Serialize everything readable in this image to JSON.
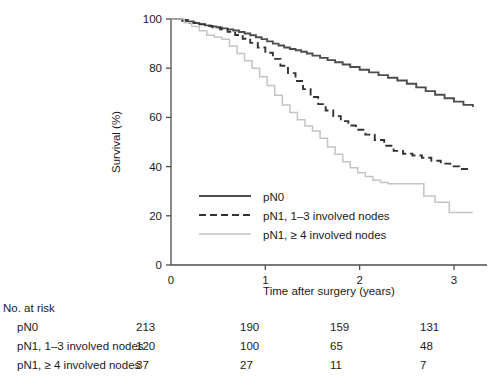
{
  "chart_data": {
    "type": "line",
    "title": "",
    "xlabel": "Time after surgery (years)",
    "ylabel": "Survival (%)",
    "xlim": [
      0,
      3.35
    ],
    "ylim": [
      0,
      100
    ],
    "xticks": [
      "0",
      "1",
      "2",
      "3"
    ],
    "xtick_values": [
      0,
      1,
      2,
      3
    ],
    "yticks": [
      "0",
      "20",
      "40",
      "60",
      "80",
      "100"
    ],
    "ytick_values": [
      0,
      20,
      40,
      60,
      80,
      100
    ],
    "grid": false,
    "legend_position": "lower-left-inside",
    "series": [
      {
        "name": "pN0",
        "style": "solid",
        "color": "#4d4d4d",
        "x": [
          0.0,
          0.12,
          0.18,
          0.24,
          0.3,
          0.36,
          0.42,
          0.48,
          0.54,
          0.6,
          0.66,
          0.72,
          0.78,
          0.84,
          0.9,
          0.96,
          1.02,
          1.08,
          1.14,
          1.2,
          1.26,
          1.32,
          1.38,
          1.44,
          1.5,
          1.58,
          1.66,
          1.74,
          1.82,
          1.9,
          2.0,
          2.1,
          2.2,
          2.3,
          2.4,
          2.5,
          2.6,
          2.7,
          2.8,
          2.9,
          3.0,
          3.1,
          3.2
        ],
        "y": [
          100.0,
          99.6,
          99.0,
          98.4,
          97.9,
          97.4,
          97.0,
          96.6,
          96.2,
          95.8,
          95.3,
          94.7,
          94.1,
          93.4,
          92.6,
          91.8,
          90.9,
          90.0,
          89.2,
          88.4,
          87.8,
          87.3,
          86.7,
          86.0,
          85.1,
          84.2,
          83.3,
          82.4,
          81.5,
          80.5,
          79.4,
          78.3,
          77.2,
          76.1,
          75.0,
          73.7,
          72.2,
          70.7,
          69.2,
          67.8,
          66.4,
          65.1,
          64.2
        ]
      },
      {
        "name": "pN1, 1–3 involved nodes",
        "style": "dashed",
        "color": "#333333",
        "x": [
          0.0,
          0.12,
          0.2,
          0.28,
          0.36,
          0.44,
          0.52,
          0.6,
          0.68,
          0.76,
          0.84,
          0.92,
          1.0,
          1.08,
          1.16,
          1.24,
          1.32,
          1.4,
          1.48,
          1.56,
          1.64,
          1.72,
          1.8,
          1.88,
          1.96,
          2.06,
          2.16,
          2.26,
          2.36,
          2.46,
          2.56,
          2.66,
          2.76,
          2.86,
          2.96,
          3.06,
          3.16
        ],
        "y": [
          100.0,
          99.3,
          98.5,
          97.8,
          97.2,
          96.6,
          95.8,
          94.8,
          93.5,
          92.0,
          90.3,
          88.4,
          86.3,
          83.8,
          81.0,
          78.0,
          74.8,
          71.5,
          68.3,
          65.4,
          62.8,
          60.5,
          58.5,
          56.7,
          55.0,
          53.0,
          50.8,
          48.5,
          46.4,
          45.2,
          44.5,
          43.6,
          42.4,
          41.2,
          40.1,
          39.0,
          38.2
        ]
      },
      {
        "name": "pN1, ≥ 4 involved nodes",
        "style": "solid-light",
        "color": "#c4c4c4",
        "x": [
          0.0,
          0.14,
          0.22,
          0.3,
          0.38,
          0.46,
          0.54,
          0.62,
          0.7,
          0.78,
          0.86,
          0.94,
          1.02,
          1.1,
          1.18,
          1.26,
          1.34,
          1.42,
          1.5,
          1.58,
          1.66,
          1.74,
          1.82,
          1.9,
          1.98,
          2.06,
          2.14,
          2.22,
          2.3,
          2.42,
          2.55,
          2.68,
          2.8,
          2.95,
          3.1,
          3.2
        ],
        "y": [
          100.0,
          98.5,
          97.0,
          95.2,
          93.4,
          92.6,
          91.8,
          89.0,
          86.0,
          83.0,
          80.0,
          76.5,
          73.0,
          69.0,
          65.0,
          62.0,
          59.0,
          56.5,
          54.5,
          51.5,
          48.0,
          45.0,
          42.0,
          39.5,
          37.5,
          36.0,
          34.5,
          33.5,
          33.0,
          33.0,
          33.0,
          28.0,
          25.5,
          21.3,
          21.3,
          21.3
        ]
      }
    ]
  },
  "legend": {
    "items": [
      {
        "label": "pN0",
        "style": "solid",
        "color": "#4d4d4d"
      },
      {
        "label": "pN1, 1–3 involved nodes",
        "style": "dashed",
        "color": "#333333"
      },
      {
        "label": "pN1, ≥ 4 involved nodes",
        "style": "solid-light",
        "color": "#c4c4c4"
      }
    ]
  },
  "risk_table": {
    "title": "No. at risk",
    "column_times": [
      "0",
      "1",
      "2",
      "3"
    ],
    "rows": [
      {
        "label": "pN0",
        "values": [
          "213",
          "190",
          "159",
          "131"
        ]
      },
      {
        "label": "pN1, 1–3 involved nodes",
        "values": [
          "120",
          "100",
          "65",
          "48"
        ]
      },
      {
        "label": "pN1, ≥ 4 involved nodes",
        "values": [
          "37",
          "27",
          "11",
          "7"
        ]
      }
    ]
  },
  "colors": {
    "axis": "#4d4d4d",
    "text": "#1a1a1a",
    "pn0": "#4d4d4d",
    "pn1_1_3": "#333333",
    "pn1_ge4": "#c4c4c4"
  }
}
